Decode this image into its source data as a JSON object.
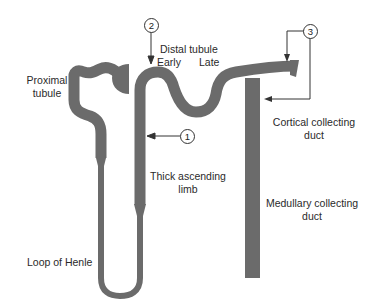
{
  "diagram": {
    "type": "nephron-anatomy",
    "tubule_color": "#6b6b6b",
    "line_color": "#333333",
    "labels": {
      "proximal_tubule": [
        "Proximal",
        "tubule"
      ],
      "distal_tubule": "Distal tubule",
      "early": "Early",
      "late": "Late",
      "cortical_collecting_duct": [
        "Cortical collecting",
        "duct"
      ],
      "thick_ascending_limb": [
        "Thick ascending",
        "limb"
      ],
      "medullary_collecting_duct": [
        "Medullary collecting",
        "duct"
      ],
      "loop_of_henle": "Loop of Henle"
    },
    "markers": [
      {
        "id": "1",
        "label": "1",
        "points_to": "thick ascending limb"
      },
      {
        "id": "2",
        "label": "2",
        "points_to": "early distal tubule"
      },
      {
        "id": "3",
        "label": "3",
        "points_to": "late distal tubule / cortical collecting duct"
      }
    ]
  }
}
